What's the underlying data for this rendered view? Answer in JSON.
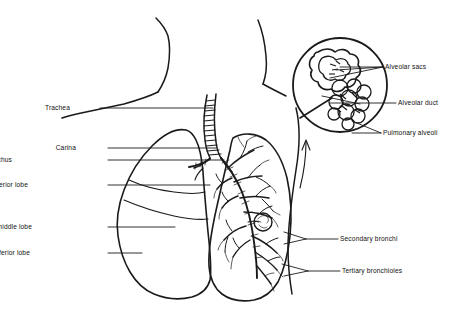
{
  "figure": {
    "background_color": "#ffffff",
    "ink_color": "#1a1a1a"
  },
  "labels_left": [
    {
      "id": "trachea",
      "text": "Trachea",
      "text_x": 70,
      "text_y": 104,
      "line_x1": 100,
      "line_x2": 213,
      "line_y": 108
    },
    {
      "id": "carina",
      "text": "Carina",
      "text_x": 76,
      "text_y": 144,
      "line_x1": 108,
      "line_x2": 216,
      "line_y": 148
    },
    {
      "id": "right-primary-bronchus",
      "text": "Right primary bronchus",
      "text_x": 12,
      "text_y": 156,
      "line_x1": 108,
      "line_x2": 224,
      "line_y": 160
    },
    {
      "id": "right-superior-lobe",
      "text": "Right superior lobe",
      "text_x": 28,
      "text_y": 181,
      "line_x1": 108,
      "line_x2": 210,
      "line_y": 185
    },
    {
      "id": "right-middle-lobe",
      "text": "Right middle lobe",
      "text_x": 32,
      "text_y": 223,
      "line_x1": 108,
      "line_x2": 175,
      "line_y": 227
    },
    {
      "id": "right-inferior-lobe",
      "text": "Right inferior lobe",
      "text_x": 30,
      "text_y": 249,
      "line_x1": 108,
      "line_x2": 142,
      "line_y": 253
    }
  ],
  "labels_right": [
    {
      "id": "alveolar-sacs",
      "text": "Alveolar sacs",
      "text_x": 385,
      "text_y": 63,
      "line_x1": 340,
      "line_x2": 383,
      "line_y": 67
    },
    {
      "id": "alveolar-duct",
      "text": "Alveolar duct",
      "text_x": 398,
      "text_y": 99,
      "line_x1": 330,
      "line_x2": 396,
      "line_y": 103
    },
    {
      "id": "pulmonary-alveoli",
      "text": "Pulmonary alveoli",
      "text_x": 383,
      "text_y": 129,
      "line_x1": 352,
      "line_x2": 381,
      "line_y": 133
    },
    {
      "id": "secondary-bronchi",
      "text": "Secondary bronchi",
      "text_x": 340,
      "text_y": 235,
      "line_x1": 306,
      "line_x2": 338,
      "line_y": 239
    },
    {
      "id": "tertiary-bronchioles",
      "text": "Tertiary bronchioles",
      "text_x": 342,
      "text_y": 267,
      "line_x1": 308,
      "line_x2": 340,
      "line_y": 271
    }
  ],
  "anatomy": {
    "magnifier_circle": {
      "cx": 340,
      "cy": 85,
      "r": 47
    },
    "trachea": {
      "top_x": 212,
      "top_y": 94,
      "carina_x": 218,
      "carina_y": 156,
      "ring_count": 14
    },
    "right_lung_label": "right lung",
    "left_lung_label": "left lung"
  }
}
